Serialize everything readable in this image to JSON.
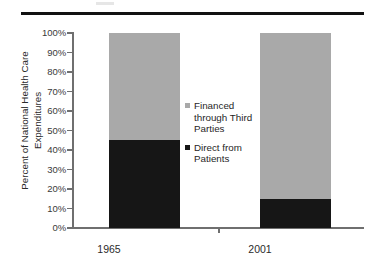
{
  "chart_data": {
    "type": "bar",
    "subtype": "100% stacked bar",
    "title": "",
    "xlabel": "",
    "ylabel": "Percent of National Health Care Expenditures",
    "ylabel_line1": "Percent of National Health Care",
    "ylabel_line2": "Expenditures",
    "categories": [
      "1965",
      "2001"
    ],
    "ylim": [
      0,
      100
    ],
    "ytick_labels": [
      "100%",
      "90%",
      "80%",
      "70%",
      "60%",
      "50%",
      "40%",
      "30%",
      "20%",
      "10%",
      "0%"
    ],
    "ytick_values": [
      100,
      90,
      80,
      70,
      60,
      50,
      40,
      30,
      20,
      10,
      0
    ],
    "grid": false,
    "legend_position": "inside plot, center",
    "series": [
      {
        "name": "Financed through Third Parties",
        "name_line1": "Financed",
        "name_line2": "through Third",
        "name_line3": "Parties",
        "color": "#a9a9a9",
        "values": [
          55,
          85
        ]
      },
      {
        "name": "Direct from Patients",
        "name_line1": "Direct from",
        "name_line2": "Patients",
        "color": "#161616",
        "values": [
          45,
          15
        ]
      }
    ]
  },
  "figure": {
    "axis_color": "#6f6f6f",
    "rule_color": "#111111",
    "background": "#ffffff"
  }
}
